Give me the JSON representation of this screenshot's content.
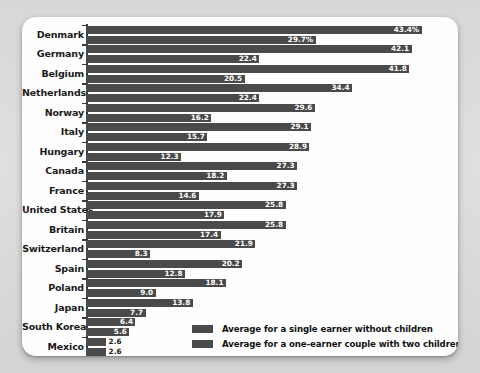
{
  "chart_data": {
    "type": "bar",
    "orientation": "horizontal",
    "title": "",
    "subtitle": "",
    "xlabel": "",
    "ylabel": "",
    "grid": false,
    "xlim": [
      0,
      45
    ],
    "legend_position": "bottom-right",
    "value_suffix_first_row": "%",
    "categories": [
      "Denmark",
      "Germany",
      "Belgium",
      "Netherlands",
      "Norway",
      "Italy",
      "Hungary",
      "Canada",
      "France",
      "United States",
      "Britain",
      "Switzerland",
      "Spain",
      "Poland",
      "Japan",
      "South Korea",
      "Mexico"
    ],
    "series": [
      {
        "name": "Average for a single earner without children",
        "color": "#4a4a4a",
        "values": [
          43.4,
          42.1,
          41.8,
          34.4,
          29.6,
          29.1,
          28.9,
          27.3,
          27.3,
          25.8,
          25.8,
          21.9,
          20.2,
          18.1,
          13.8,
          6.4,
          2.6
        ],
        "labels": [
          "43.4%",
          "42.1",
          "41.8",
          "34.4",
          "29.6",
          "29.1",
          "28.9",
          "27.3",
          "27.3",
          "25.8",
          "25.8",
          "21.9",
          "20.2",
          "18.1",
          "13.8",
          "6.4",
          "2.6"
        ]
      },
      {
        "name": "Average for a one-earner couple with two children",
        "color": "#4a4a4a",
        "values": [
          29.7,
          22.4,
          20.5,
          22.4,
          16.2,
          15.7,
          12.3,
          18.2,
          14.6,
          17.9,
          17.4,
          8.3,
          12.8,
          9.0,
          7.7,
          5.6,
          2.6
        ],
        "labels": [
          "29.7%",
          "22.4",
          "20.5",
          "22.4",
          "16.2",
          "15.7",
          "12.3",
          "18.2",
          "14.6",
          "17.9",
          "17.4",
          "8.3",
          "12.8",
          "9.0",
          "7.7",
          "5.6",
          "2.6"
        ]
      }
    ]
  },
  "legend": {
    "items": [
      {
        "label": "Average for a single earner without children"
      },
      {
        "label": "Average for a one-earner couple with two children"
      }
    ]
  }
}
